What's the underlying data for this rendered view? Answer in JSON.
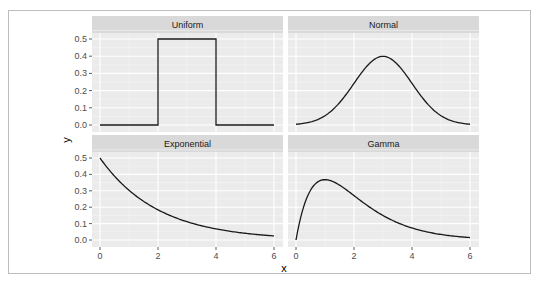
{
  "chart_data": {
    "type": "line",
    "title": "",
    "xlabel": "x",
    "ylabel": "y",
    "layout": "facet_wrap 2x2",
    "grid": true,
    "legend": "none",
    "xlim": [
      0,
      6
    ],
    "ylim": [
      0,
      0.5
    ],
    "x_ticks": [
      "0",
      "2",
      "4",
      "6"
    ],
    "y_ticks": [
      "0.0",
      "0.1",
      "0.2",
      "0.3",
      "0.4",
      "0.5"
    ],
    "panels": [
      {
        "name": "Uniform",
        "distribution": "uniform(2,4)",
        "x": [
          0,
          2,
          2,
          4,
          4,
          6
        ],
        "y": [
          0,
          0,
          0.5,
          0.5,
          0,
          0
        ]
      },
      {
        "name": "Normal",
        "distribution": "normal(mean=3, sd=1)",
        "x": [
          0,
          0.5,
          1,
          1.5,
          2,
          2.5,
          3,
          3.5,
          4,
          4.5,
          5,
          5.5,
          6
        ],
        "y": [
          0.004,
          0.018,
          0.054,
          0.13,
          0.242,
          0.352,
          0.399,
          0.352,
          0.242,
          0.13,
          0.054,
          0.018,
          0.004
        ]
      },
      {
        "name": "Exponential",
        "distribution": "exponential(rate=0.5)",
        "x": [
          0,
          0.5,
          1,
          1.5,
          2,
          2.5,
          3,
          3.5,
          4,
          4.5,
          5,
          5.5,
          6
        ],
        "y": [
          0.5,
          0.389,
          0.303,
          0.236,
          0.184,
          0.143,
          0.112,
          0.087,
          0.068,
          0.053,
          0.041,
          0.032,
          0.025
        ]
      },
      {
        "name": "Gamma",
        "distribution": "gamma(shape=2, rate=1)",
        "x": [
          0,
          0.25,
          0.5,
          0.75,
          1,
          1.5,
          2,
          2.5,
          3,
          3.5,
          4,
          4.5,
          5,
          5.5,
          6
        ],
        "y": [
          0,
          0.195,
          0.303,
          0.354,
          0.368,
          0.335,
          0.271,
          0.205,
          0.149,
          0.106,
          0.073,
          0.05,
          0.034,
          0.022,
          0.015
        ]
      }
    ]
  },
  "colors": {
    "panel_bg": "#ebebeb",
    "strip_bg": "#d9d9d9",
    "grid_major": "#ffffff",
    "line": "#1a1a1a",
    "frame": "#bdbdbd"
  }
}
